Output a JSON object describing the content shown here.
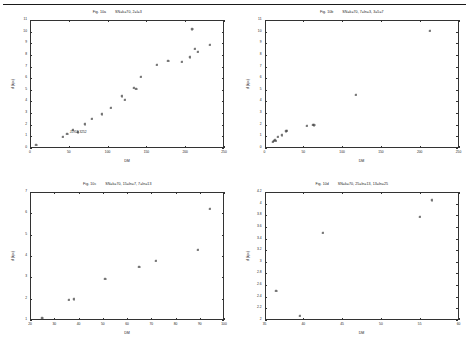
{
  "page": {
    "background": "#ffffff",
    "ink": "#1a1a1a",
    "has_top_rule": true
  },
  "chart_data": [
    {
      "panel_id": "panel-a",
      "type": "scatter",
      "title": "Fig. 10a",
      "title_params": "SN=k=70, 2=l=3",
      "xlabel": "DM",
      "ylabel": "d (kpc)",
      "xlim": [
        0,
        250
      ],
      "ylim": [
        0,
        11
      ],
      "xticks": [
        0,
        50,
        100,
        150,
        200,
        250
      ],
      "yticks": [
        0,
        1,
        2,
        3,
        4,
        5,
        6,
        7,
        8,
        9,
        10,
        11
      ],
      "grid": false,
      "legend": "none",
      "marker": "plus",
      "annotation": {
        "text": "J1952-3252",
        "x": 62,
        "y": 1.35
      },
      "points": [
        {
          "x": 8,
          "y": 0.25
        },
        {
          "x": 42,
          "y": 1.0
        },
        {
          "x": 48,
          "y": 1.25
        },
        {
          "x": 55,
          "y": 1.55
        },
        {
          "x": 62,
          "y": 1.35
        },
        {
          "x": 70,
          "y": 2.05
        },
        {
          "x": 80,
          "y": 2.5
        },
        {
          "x": 92,
          "y": 2.9
        },
        {
          "x": 104,
          "y": 3.45
        },
        {
          "x": 118,
          "y": 4.45
        },
        {
          "x": 122,
          "y": 4.15
        },
        {
          "x": 134,
          "y": 5.2
        },
        {
          "x": 137,
          "y": 5.1
        },
        {
          "x": 143,
          "y": 6.1
        },
        {
          "x": 163,
          "y": 7.15
        },
        {
          "x": 178,
          "y": 7.5
        },
        {
          "x": 195,
          "y": 7.4
        },
        {
          "x": 206,
          "y": 7.8
        },
        {
          "x": 209,
          "y": 10.2
        },
        {
          "x": 212,
          "y": 8.5
        },
        {
          "x": 216,
          "y": 8.3
        },
        {
          "x": 232,
          "y": 8.9
        }
      ]
    },
    {
      "panel_id": "panel-b",
      "type": "scatter",
      "title": "Fig. 10b",
      "title_params": "SN=k=70, 7=ln=3, 3=5=7",
      "xlabel": "DM",
      "ylabel": "d (kpc)",
      "xlim": [
        0,
        250
      ],
      "ylim": [
        0,
        11
      ],
      "xticks": [
        0,
        50,
        100,
        150,
        200,
        250
      ],
      "yticks": [
        0,
        1,
        2,
        3,
        4,
        5,
        6,
        7,
        8,
        9,
        10,
        11
      ],
      "grid": false,
      "legend": "none",
      "marker": "plus",
      "points": [
        {
          "x": 11,
          "y": 0.55
        },
        {
          "x": 12,
          "y": 0.6
        },
        {
          "x": 13,
          "y": 0.7
        },
        {
          "x": 14,
          "y": 0.65
        },
        {
          "x": 17,
          "y": 0.95
        },
        {
          "x": 22,
          "y": 1.1
        },
        {
          "x": 27,
          "y": 1.45
        },
        {
          "x": 29,
          "y": 1.5
        },
        {
          "x": 54,
          "y": 1.9
        },
        {
          "x": 62,
          "y": 2.0
        },
        {
          "x": 64,
          "y": 1.95
        },
        {
          "x": 118,
          "y": 4.6
        },
        {
          "x": 213,
          "y": 10.1
        }
      ]
    },
    {
      "panel_id": "panel-c",
      "type": "scatter",
      "title": "Fig. 10c",
      "title_params": "SN=k=70, 15=ln=7, 7=ln=13",
      "xlabel": "DM",
      "ylabel": "d (kpc)",
      "xlim": [
        20,
        100
      ],
      "ylim": [
        1,
        7
      ],
      "xticks": [
        20,
        30,
        40,
        50,
        60,
        70,
        80,
        90,
        100
      ],
      "yticks": [
        1,
        2,
        3,
        4,
        5,
        6,
        7
      ],
      "grid": false,
      "legend": "none",
      "marker": "plus",
      "points": [
        {
          "x": 25,
          "y": 1.08
        },
        {
          "x": 36,
          "y": 1.95
        },
        {
          "x": 38,
          "y": 1.97
        },
        {
          "x": 51,
          "y": 2.92
        },
        {
          "x": 65,
          "y": 3.5
        },
        {
          "x": 72,
          "y": 3.78
        },
        {
          "x": 89,
          "y": 4.28
        },
        {
          "x": 94,
          "y": 6.2
        }
      ]
    },
    {
      "panel_id": "panel-d",
      "type": "scatter",
      "title": "Fig. 10d",
      "title_params": "SN=k=70, 25=ln=13, 13=ln=25",
      "xlabel": "DM",
      "ylabel": "d (kpc)",
      "xlim": [
        35,
        60
      ],
      "ylim": [
        2,
        4.2
      ],
      "xticks": [
        35,
        40,
        45,
        50,
        55,
        60
      ],
      "yticks": [
        2,
        2.2,
        2.4,
        2.6,
        2.8,
        3,
        3.2,
        3.4,
        3.6,
        3.8,
        4,
        4.2
      ],
      "grid": false,
      "legend": "none",
      "marker": "plus",
      "points": [
        {
          "x": 36.5,
          "y": 2.5
        },
        {
          "x": 39.5,
          "y": 2.07
        },
        {
          "x": 42.5,
          "y": 3.5
        },
        {
          "x": 55.0,
          "y": 3.78
        },
        {
          "x": 56.5,
          "y": 4.06
        }
      ]
    }
  ]
}
